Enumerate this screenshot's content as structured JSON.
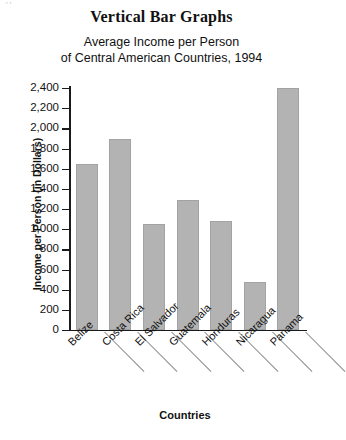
{
  "titles": {
    "main": "Vertical Bar Graphs",
    "subtitle_line1": "Average Income per Person",
    "subtitle_line2": "of Central American Countries, 1994"
  },
  "axes": {
    "y_title": "Income per Person (in Dollars)",
    "x_title": "Countries"
  },
  "chart_data": {
    "type": "bar",
    "title": "Vertical Bar Graphs",
    "subtitle": "Average Income per Person of Central American Countries, 1994",
    "xlabel": "Countries",
    "ylabel": "Income per Person (in Dollars)",
    "categories": [
      "Belize",
      "Costa Rica",
      "El Salvador",
      "Guatemala",
      "Honduras",
      "Nicaragua",
      "Panama"
    ],
    "values": [
      1650,
      1890,
      1050,
      1290,
      1080,
      480,
      2400
    ],
    "ylim": [
      0,
      2400
    ],
    "ytick_step": 200,
    "ytick_labels": [
      "0",
      "200",
      "400",
      "600",
      "800",
      "1,000",
      "1,200",
      "1,400",
      "1,600",
      "1,800",
      "2,000",
      "2,200",
      "2,400"
    ],
    "ytick_values": [
      0,
      200,
      400,
      600,
      800,
      1000,
      1200,
      1400,
      1600,
      1800,
      2000,
      2200,
      2400
    ],
    "grid": false,
    "legend": null,
    "bar_color": "#b3b3b3",
    "axis_color": "#1a1a1a"
  }
}
